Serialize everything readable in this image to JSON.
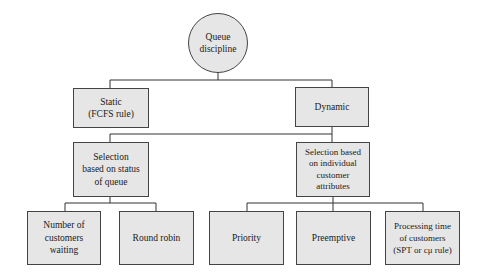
{
  "diagram": {
    "type": "tree",
    "colors": {
      "fill": "#e6e6e6",
      "stroke": "#444444",
      "background": "#ffffff"
    },
    "root": {
      "label": "Queue\ndiscipline"
    },
    "level1": [
      {
        "label": "Static\n(FCFS rule)"
      },
      {
        "label": "Dynamic"
      }
    ],
    "level2": [
      {
        "label": "Selection\nbased on status\nof queue"
      },
      {
        "label": "Selection based\non individual\ncustomer\nattributes"
      }
    ],
    "level3_status": [
      {
        "label": "Number of\ncustomers\nwaiting"
      },
      {
        "label": "Round robin"
      }
    ],
    "level3_attributes": [
      {
        "label": "Priority"
      },
      {
        "label": "Preemptive"
      },
      {
        "label": "Processing time\nof customers\n(SPT or cμ rule)"
      }
    ]
  }
}
